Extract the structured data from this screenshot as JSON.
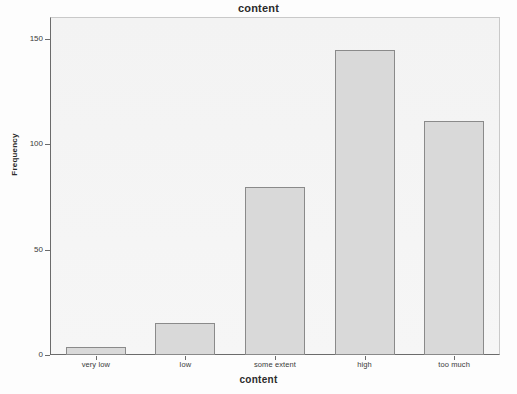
{
  "chart_data": {
    "type": "bar",
    "title": "content",
    "xlabel": "content",
    "ylabel": "Frequency",
    "categories": [
      "very low",
      "low",
      "some extent",
      "high",
      "too much"
    ],
    "values": [
      4,
      15,
      80,
      145,
      111
    ],
    "ylim": [
      0,
      160
    ],
    "yticks": [
      0,
      50,
      100,
      150
    ],
    "ytick_labels": [
      "0",
      "50",
      "100",
      "150"
    ],
    "grid": false,
    "legend": false,
    "bar_fill_color": "#d9d9d9",
    "bar_border_color": "#8a8a8a",
    "plot_background_color": "#f4f4f4",
    "axis_color": "#6b6b6b",
    "text_color": "#2b2b2b"
  }
}
